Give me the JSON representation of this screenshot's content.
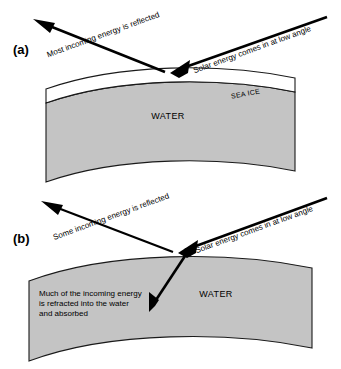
{
  "figure": {
    "type": "scientific-diagram",
    "background_color": "#ffffff",
    "water_color": "#c4c4c4",
    "ice_color": "#ffffff",
    "outline_color": "#1a1a1a",
    "arrow_color": "#000000"
  },
  "panels": [
    {
      "id": "panel-a",
      "letter": "(a)",
      "surface": "sea-ice",
      "layers": [
        {
          "name": "sea-ice",
          "label": "SEA ICE",
          "color": "#ffffff"
        },
        {
          "name": "water",
          "label": "WATER",
          "color": "#c4c4c4"
        }
      ],
      "arrows": [
        {
          "name": "incoming-solar",
          "label": "Solar energy comes in at low angle",
          "direction": "down-left",
          "angle_deg": -22
        },
        {
          "name": "reflected-energy",
          "label": "Most incoming energy is reflected",
          "direction": "up-left",
          "angle_deg": -22
        }
      ]
    },
    {
      "id": "panel-b",
      "letter": "(b)",
      "surface": "open-water",
      "layers": [
        {
          "name": "water",
          "label": "WATER",
          "color": "#c4c4c4"
        }
      ],
      "arrows": [
        {
          "name": "incoming-solar",
          "label": "Solar energy comes in at low angle",
          "direction": "down-left",
          "angle_deg": -22
        },
        {
          "name": "reflected-energy",
          "label": "Some incoming energy is reflected",
          "direction": "up-left",
          "angle_deg": -22
        },
        {
          "name": "refracted-energy",
          "label": "",
          "direction": "down-left-steep",
          "angle_deg": 0
        }
      ],
      "notes": [
        {
          "name": "refraction-note",
          "lines": [
            "Much of the incoming energy",
            " is refracted into the water",
            "and absorbed"
          ]
        }
      ]
    }
  ]
}
